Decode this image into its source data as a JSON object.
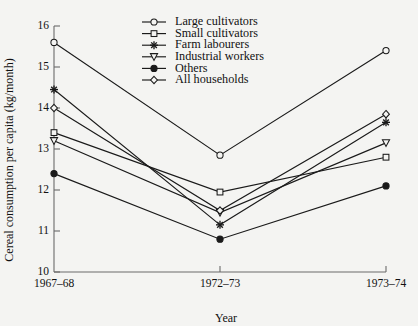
{
  "chart_data": {
    "type": "line",
    "title": "",
    "xlabel": "Year",
    "ylabel": "Cereal consumption per capita (kg/month)",
    "categories": [
      "1967–68",
      "1972–73",
      "1973–74"
    ],
    "ylim": [
      10,
      16
    ],
    "yticks": [
      10,
      11,
      12,
      13,
      14,
      15,
      16
    ],
    "ytick_labels": [
      "10",
      "11",
      "12",
      "13",
      "14",
      "15",
      "16"
    ],
    "grid": false,
    "legend_position": "top-center",
    "series": [
      {
        "name": "Large cultivators",
        "marker": "circle-open",
        "values": [
          15.6,
          12.85,
          15.4
        ]
      },
      {
        "name": "Small cultivators",
        "marker": "square-open",
        "values": [
          13.4,
          11.95,
          12.8
        ]
      },
      {
        "name": "Farm labourers",
        "marker": "star",
        "values": [
          14.45,
          11.15,
          13.65
        ]
      },
      {
        "name": "Industrial workers",
        "marker": "triangle-down",
        "values": [
          13.2,
          11.45,
          13.15
        ]
      },
      {
        "name": "Others",
        "marker": "circle-filled",
        "values": [
          12.4,
          10.8,
          12.1
        ]
      },
      {
        "name": "All households",
        "marker": "diamond-open",
        "values": [
          14.0,
          11.5,
          13.85
        ]
      }
    ]
  },
  "colors": {
    "background": "#f4f4f2",
    "ink": "#1a1a1a",
    "axis": "#6b6b6b"
  }
}
